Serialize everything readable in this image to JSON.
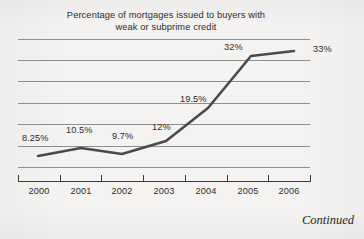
{
  "figure": {
    "title_line_1": "Percentage of mortgages issued to buyers with",
    "title_line_2": "weak or subprime credit",
    "continued_note": "Continued",
    "line_color": "#4a4a4a",
    "gridline_color": "#8e8e8e",
    "axis_color": "#3a3a3a",
    "text_color": "#2c2c2c",
    "background_color": "#f4f3f1"
  },
  "chart_data": {
    "type": "line",
    "title": "Percentage of mortgages issued to buyers with weak or subprime credit",
    "xlabel": "",
    "ylabel": "",
    "categories": [
      "2000",
      "2001",
      "2002",
      "2003",
      "2004",
      "2005",
      "2006"
    ],
    "values": [
      8.25,
      10.5,
      9.7,
      12,
      19.5,
      32,
      33
    ],
    "data_labels": [
      "8.25%",
      "10.5%",
      "9.7%",
      "12%",
      "19.5%",
      "32%",
      "33%"
    ],
    "ylim": [
      0,
      40
    ],
    "grid": true,
    "gridline_count": 7,
    "legend": "none",
    "axis_tick_count": 8
  },
  "gridlines": [
    39,
    60,
    81,
    103,
    124,
    146,
    167
  ],
  "x_ticks": [
    18,
    60,
    101,
    143,
    185,
    227,
    268,
    310
  ],
  "x_labels": [
    {
      "text": "2000",
      "left": 18
    },
    {
      "text": "2001",
      "left": 60
    },
    {
      "text": "2002",
      "left": 101
    },
    {
      "text": "2003",
      "left": 143
    },
    {
      "text": "2004",
      "left": 185
    },
    {
      "text": "2005",
      "left": 227
    },
    {
      "text": "2006",
      "left": 268
    }
  ],
  "point_labels": [
    {
      "text": "8.25%",
      "left": 22,
      "top": 133
    },
    {
      "text": "10.5%",
      "left": 66,
      "top": 125
    },
    {
      "text": "9.7%",
      "left": 112,
      "top": 131
    },
    {
      "text": "12%",
      "left": 152,
      "top": 122
    },
    {
      "text": "19.5%",
      "left": 180,
      "top": 94
    },
    {
      "text": "32%",
      "left": 224,
      "top": 42
    },
    {
      "text": "33%",
      "left": 313,
      "top": 44
    }
  ],
  "series_path": "M 38,156 L 81,148 L 122,154 L 166,141 L 208,108 L 251,56 L 294,51"
}
